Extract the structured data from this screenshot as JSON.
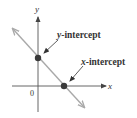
{
  "diagram": {
    "title": "",
    "axes": {
      "x_label": "x",
      "y_label": "y",
      "origin_label": "0"
    },
    "annotations": {
      "y_intercept": {
        "label_italic": "y",
        "label_rest": "-intercept"
      },
      "x_intercept": {
        "label_italic": "x",
        "label_rest": "-intercept"
      }
    },
    "colors": {
      "axis": "#555555",
      "line": "#a9a9a9",
      "point": "#3a3a3a",
      "text": "#333333"
    }
  }
}
